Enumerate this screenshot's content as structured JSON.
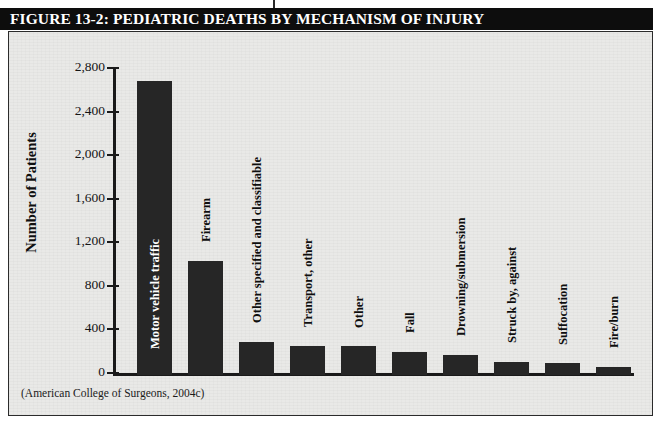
{
  "figure": {
    "title": "FIGURE 13-2: PEDIATRIC DEATHS BY MECHANISM OF INJURY",
    "source_caption": "(American College of Surgeons, 2004c)",
    "title_bar_color": "#0d0d0d",
    "title_text_color": "#ffffff",
    "paper_color": "#e9e9e7",
    "bar_color": "#262626",
    "axis_color": "#1a1a1a"
  },
  "chart_data": {
    "type": "bar",
    "title": "FIGURE 13-2: PEDIATRIC DEATHS BY MECHANISM OF INJURY",
    "xlabel": "",
    "ylabel": "Number of Patients",
    "ylim": [
      0,
      2800
    ],
    "yticks": [
      0,
      400,
      800,
      1200,
      1600,
      2000,
      2400,
      2800
    ],
    "ytick_labels": [
      "0",
      "400",
      "800",
      "1,200",
      "1,600",
      "2,000",
      "2,400",
      "2,800"
    ],
    "grid": false,
    "legend": "none",
    "categories": [
      "Motor vehicle traffic",
      "Firearm",
      "Other specified and classifiable",
      "Transport, other",
      "Other",
      "Fall",
      "Drowning/submersion",
      "Struck by, against",
      "Suffocation",
      "Fire/burn"
    ],
    "values": [
      2700,
      1050,
      305,
      270,
      265,
      215,
      185,
      120,
      110,
      75
    ],
    "label_placement": [
      "inside",
      "above",
      "above",
      "above",
      "above",
      "above",
      "above",
      "above",
      "above",
      "above"
    ]
  }
}
